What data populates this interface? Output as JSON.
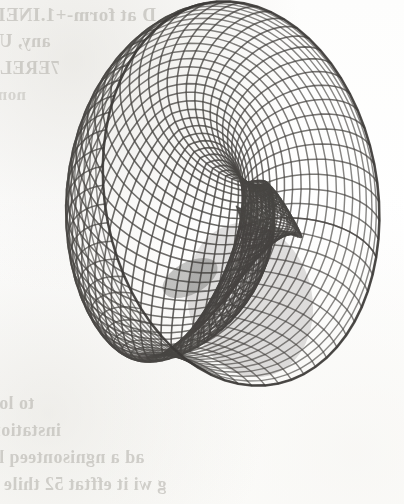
{
  "page": {
    "width": 404,
    "height": 504,
    "background_color": "#fefefe",
    "medium": "scanned-book-page"
  },
  "figure": {
    "name": "wireframe-surface",
    "kind": "3d-parametric-surface-mesh",
    "ink_color": "#4a4845",
    "shadow_color": "#3d3b38",
    "highlight_color": "#ffffff",
    "bounds": {
      "left": 35,
      "top": 28,
      "right": 330,
      "bottom": 458
    },
    "mesh": {
      "u_lines": 64,
      "v_lines": 46,
      "cell_size_px": 11,
      "line_width_px": 1.6
    },
    "features": [
      {
        "name": "outer-bowl-rim",
        "note": "large elliptical rim sweeping the full outline"
      },
      {
        "name": "self-intersection-lobe",
        "note": "dark inner lobe, right of centre, where sheets cross"
      },
      {
        "name": "fold-crease",
        "note": "diagonal crease running lower-left to centre"
      },
      {
        "name": "pinch-point",
        "note": "dark pinch near centre at approx (190, 278)"
      }
    ]
  },
  "bleed_through": {
    "note": "mirrored show-through text from the reverse side of the page",
    "color": "#b9b7b1",
    "top_block": [
      "D at form-+1.INELL.",
      "any, Unix",
      "7ERELIC,",
      "nomon",
      "rely"
    ],
    "bottom_block": [
      "lat",
      "to lot?",
      "instations",
      "ad a ngnisonteeq lot",
      "g wi it efftat 52 thile in"
    ]
  }
}
